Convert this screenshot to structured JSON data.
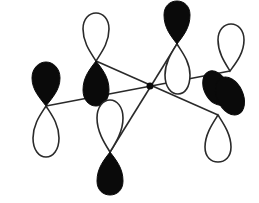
{
  "diagram": {
    "title": "",
    "colors": {
      "filled_lobe": "#0a0a0a",
      "hollow_lobe": "#ffffff",
      "outline": "#2a2a2a",
      "background": "#ffffff"
    },
    "center_atom": {
      "x": 150,
      "y": 86
    },
    "orbitals": [
      {
        "id": "left",
        "node": [
          46,
          106
        ],
        "filled_lobe_direction": "up",
        "hollow_lobe_direction": "down"
      },
      {
        "id": "upper-left",
        "node": [
          96,
          61
        ],
        "filled_lobe_direction": "down",
        "hollow_lobe_direction": "up"
      },
      {
        "id": "top",
        "node": [
          177,
          44
        ],
        "filled_lobe_direction": "up",
        "hollow_lobe_direction": "down"
      },
      {
        "id": "right-upper",
        "node": [
          230,
          71
        ],
        "filled_lobe_direction": "down",
        "hollow_lobe_direction": "up"
      },
      {
        "id": "right-lower",
        "node": [
          218,
          115
        ],
        "filled_lobe_direction": "up",
        "hollow_lobe_direction": "down"
      },
      {
        "id": "bottom",
        "node": [
          110,
          152
        ],
        "filled_lobe_direction": "down",
        "hollow_lobe_direction": "up"
      }
    ],
    "labels": []
  }
}
